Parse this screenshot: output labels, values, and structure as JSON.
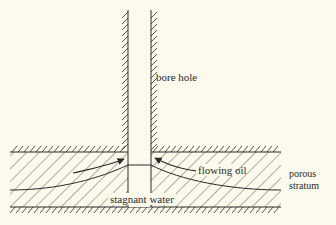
{
  "diagram": {
    "type": "cross-section",
    "background": "#fbfaec",
    "line_color": "#2a2a2a",
    "labels": {
      "bore_hole": "bore hole",
      "flowing_oil": "flowing oil",
      "stagnant_water": "stagnant water",
      "porous_line1": "porous",
      "porous_line2": "stratum"
    },
    "components": [
      {
        "id": "bore-hole",
        "description": "vertical shaft with hatched walls"
      },
      {
        "id": "porous-stratum",
        "description": "diagonally hatched layer bounded by hatched impermeable strata"
      },
      {
        "id": "flowing-oil",
        "description": "arrows converging toward bore hole above the water"
      },
      {
        "id": "stagnant-water",
        "description": "lower layer below oil-water interface"
      }
    ]
  }
}
